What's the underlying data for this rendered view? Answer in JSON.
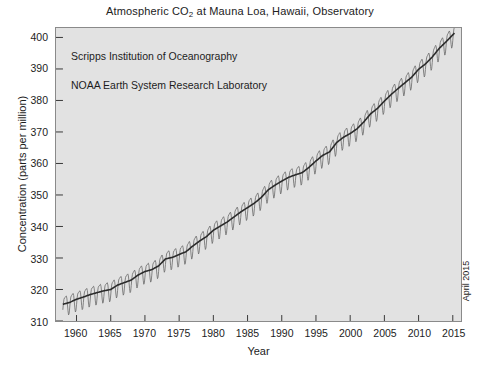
{
  "figure": {
    "title_prefix": "Atmospheric CO",
    "title_sub": "2",
    "title_suffix": " at Mauna Loa, Hawaii, Observatory",
    "title_full": "Atmospheric CO2 at Mauna Loa, Hawaii, Observatory",
    "corner_note": "April 2015",
    "background_color": "#ffffff",
    "plot_background_color": "#e2e2e2",
    "frame_color": "#8a8a8a",
    "trend_color": "#2b2b2b",
    "monthly_color": "#6a6a6a"
  },
  "annotations": [
    "Scripps Institution of Oceanography",
    "NOAA Earth System Research Laboratory"
  ],
  "chart_data": {
    "type": "line",
    "title": "Atmospheric CO2 at Mauna Loa, Hawaii, Observatory",
    "subtitle": "",
    "xlabel": "Year",
    "ylabel": "Concentration (parts per million)",
    "xlim": [
      1957.0,
      2016.2
    ],
    "ylim": [
      310,
      403
    ],
    "xticks": [
      1960,
      1965,
      1970,
      1975,
      1980,
      1985,
      1990,
      1995,
      2000,
      2005,
      2010,
      2015
    ],
    "yticks": [
      310,
      320,
      330,
      340,
      350,
      360,
      370,
      380,
      390,
      400
    ],
    "grid": false,
    "legend_position": "none",
    "annotations": [
      "Scripps Institution of Oceanography",
      "NOAA Earth System Research Laboratory"
    ],
    "seasonal_amplitude_ppm": 6.0,
    "seasonal_peak_month": "May",
    "seasonal_min_month": "October",
    "series": [
      {
        "name": "Annual mean trend (seasonally adjusted)",
        "style": "thick-line",
        "x": [
          1958,
          1959,
          1960,
          1961,
          1962,
          1963,
          1964,
          1965,
          1966,
          1967,
          1968,
          1969,
          1970,
          1971,
          1972,
          1973,
          1974,
          1975,
          1976,
          1977,
          1978,
          1979,
          1980,
          1981,
          1982,
          1983,
          1984,
          1985,
          1986,
          1987,
          1988,
          1989,
          1990,
          1991,
          1992,
          1993,
          1994,
          1995,
          1996,
          1997,
          1998,
          1999,
          2000,
          2001,
          2002,
          2003,
          2004,
          2005,
          2006,
          2007,
          2008,
          2009,
          2010,
          2011,
          2012,
          2013,
          2014,
          2015.3
        ],
        "values": [
          315.3,
          315.9,
          316.9,
          317.6,
          318.4,
          319.0,
          319.6,
          320.0,
          321.4,
          322.2,
          323.0,
          324.6,
          325.7,
          326.3,
          327.5,
          329.7,
          330.2,
          331.1,
          332.0,
          333.8,
          335.4,
          336.8,
          338.8,
          340.1,
          341.4,
          343.0,
          344.6,
          346.0,
          347.4,
          349.2,
          351.6,
          353.1,
          354.4,
          355.6,
          356.4,
          357.1,
          358.8,
          360.8,
          362.6,
          363.7,
          366.6,
          368.3,
          369.5,
          371.0,
          373.2,
          375.8,
          377.5,
          379.8,
          381.9,
          383.8,
          385.6,
          387.4,
          389.9,
          391.6,
          393.8,
          396.5,
          398.6,
          401.5
        ]
      },
      {
        "name": "Monthly mean CO2",
        "style": "thin-line-sawtooth",
        "derived_from": "Annual mean trend plus seasonal cycle",
        "description": "Monthly values oscillate about the trend by roughly +3 ppm in May and -3 ppm in late September/October each year"
      }
    ]
  }
}
